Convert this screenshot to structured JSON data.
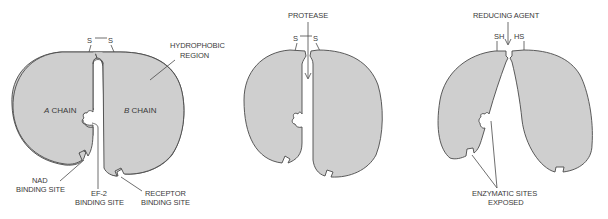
{
  "diagram": {
    "panels": [
      {
        "id": "intact",
        "labels": {
          "disulfide_left": "S",
          "disulfide_right": "S",
          "hydrophobic_line1": "HYDROPHOBIC",
          "hydrophobic_line2": "REGION",
          "a_chain_italic": "A",
          "a_chain_rest": " CHAIN",
          "b_chain_italic": "B",
          "b_chain_rest": " CHAIN",
          "nad_line1": "NAD",
          "nad_line2": "BINDING SITE",
          "ef2_line1": "EF-2",
          "ef2_line2": "BINDING SITE",
          "receptor_line1": "RECEPTOR",
          "receptor_line2": "BINDING SITE"
        }
      },
      {
        "id": "protease-cleaved",
        "labels": {
          "agent": "PROTEASE",
          "disulfide_left": "S",
          "disulfide_right": "S"
        }
      },
      {
        "id": "reduced",
        "labels": {
          "agent": "REDUCING AGENT",
          "thiol_left": "SH",
          "thiol_right": "HS",
          "exposed_line1": "ENZYMATIC SITES",
          "exposed_line2": "EXPOSED"
        }
      }
    ],
    "colors": {
      "fill": "#cfcfcf",
      "stroke": "#4a4a4a",
      "text": "#3a3a3a"
    }
  }
}
